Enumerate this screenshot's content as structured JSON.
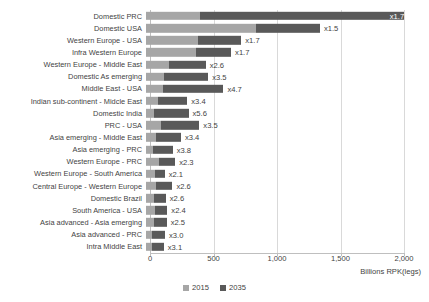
{
  "chart_data": {
    "type": "bar",
    "orientation": "horizontal",
    "stacked": true,
    "title": "",
    "xlabel": "Billions RPK(legs)",
    "ylabel": "",
    "xlim": [
      0,
      2150
    ],
    "xticks": [
      0,
      500,
      1000,
      1500,
      2000
    ],
    "xticklabels": [
      "0",
      "500",
      "1,000",
      "1,500",
      "2,000"
    ],
    "grid": true,
    "legend_position": "bottom-center",
    "categories": [
      "Domestic PRC",
      "Domestic USA",
      "Western Europe - USA",
      "Infra Western Europe",
      "Western Europe - Middle East",
      "Domestic As emerging",
      "Middle East - USA",
      "Indian sub-continent - Midcle East",
      "Domestic India",
      "PRC - USA",
      "Asia emerging - Middle East",
      "Asia emerging - PRC",
      "Western Europe - PRC",
      "Western Europe - South America",
      "Central Europe - Western Europe",
      "Domestic Brazil",
      "South America - USA",
      "Asia advanced - Asia emerging",
      "Asia advanced - PRC",
      "Intra Middle East"
    ],
    "series": [
      {
        "name": "2015",
        "color": "#a6a6a6",
        "values": [
          425,
          870,
          410,
          390,
          180,
          140,
          130,
          95,
          60,
          120,
          80,
          55,
          100,
          70,
          80,
          60,
          70,
          65,
          50,
          45
        ]
      },
      {
        "name": "2035",
        "color": "#595959",
        "values": [
          1605,
          500,
          340,
          280,
          290,
          350,
          480,
          230,
          275,
          300,
          195,
          155,
          130,
          77,
          128,
          96,
          98,
          98,
          100,
          95
        ]
      }
    ],
    "annotations": [
      "x1.7",
      "x1.5",
      "x1.7",
      "x1.7",
      "x2.6",
      "x3.5",
      "x4.7",
      "x3.4",
      "x5.6",
      "x3.5",
      "x3.4",
      "x3.8",
      "x2.3",
      "x2.1",
      "x2.6",
      "x2.6",
      "x2.4",
      "x2.5",
      "x3.0",
      "x3.1"
    ],
    "annotation_inside": [
      true,
      false,
      false,
      false,
      false,
      false,
      false,
      false,
      false,
      false,
      false,
      false,
      false,
      false,
      false,
      false,
      false,
      false,
      false,
      false
    ]
  },
  "legend": {
    "items": [
      {
        "label": "2015",
        "color": "#a6a6a6"
      },
      {
        "label": "2035",
        "color": "#595959"
      }
    ]
  }
}
